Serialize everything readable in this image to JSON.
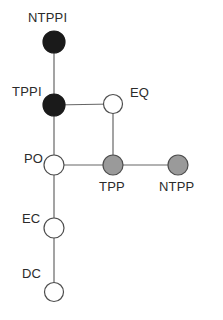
{
  "diagram": {
    "background_color": "#ffffff",
    "edge_color": "#666666",
    "edge_width": 1.2,
    "label_color": "#2b2b2b",
    "node_stroke_color": "#4d4d4d",
    "fills": {
      "black": "#1a1a1a",
      "white": "#ffffff",
      "gray": "#9a9a9a"
    },
    "nodes": [
      {
        "id": "NTPPI",
        "label": "NTPPI",
        "x": 54,
        "y": 42,
        "r": 11,
        "fill": "black",
        "label_x": 28,
        "label_y": 11
      },
      {
        "id": "TPPI",
        "label": "TPPI",
        "x": 54,
        "y": 105,
        "r": 11,
        "fill": "black",
        "label_x": 12,
        "label_y": 85
      },
      {
        "id": "EQ",
        "label": "EQ",
        "x": 113,
        "y": 104,
        "r": 9.5,
        "fill": "white",
        "label_x": 130,
        "label_y": 86
      },
      {
        "id": "PO",
        "label": "PO",
        "x": 54,
        "y": 165,
        "r": 10,
        "fill": "white",
        "label_x": 24,
        "label_y": 152
      },
      {
        "id": "TPP",
        "label": "TPP",
        "x": 113,
        "y": 165,
        "r": 10,
        "fill": "gray",
        "label_x": 99,
        "label_y": 180
      },
      {
        "id": "NTPP",
        "label": "NTPP",
        "x": 178,
        "y": 165,
        "r": 10,
        "fill": "gray",
        "label_x": 159,
        "label_y": 180
      },
      {
        "id": "EC",
        "label": "EC",
        "x": 54,
        "y": 228,
        "r": 10,
        "fill": "white",
        "label_x": 22,
        "label_y": 212
      },
      {
        "id": "DC",
        "label": "DC",
        "x": 54,
        "y": 292,
        "r": 9.5,
        "fill": "white",
        "label_x": 22,
        "label_y": 267
      }
    ],
    "edges": [
      {
        "from": "NTPPI",
        "to": "TPPI"
      },
      {
        "from": "TPPI",
        "to": "EQ"
      },
      {
        "from": "TPPI",
        "to": "PO"
      },
      {
        "from": "EQ",
        "to": "TPP"
      },
      {
        "from": "PO",
        "to": "TPP"
      },
      {
        "from": "TPP",
        "to": "NTPP"
      },
      {
        "from": "PO",
        "to": "EC"
      },
      {
        "from": "EC",
        "to": "DC"
      }
    ]
  }
}
